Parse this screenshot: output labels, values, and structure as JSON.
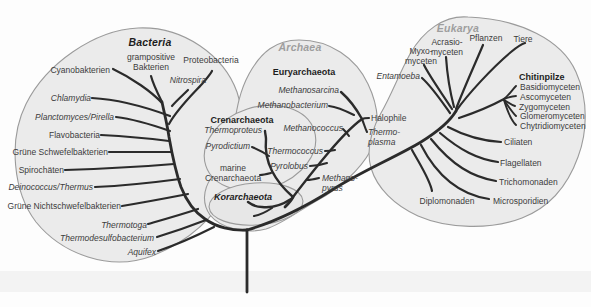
{
  "figure_type": "phylogenetic-tree-of-life",
  "colors": {
    "blob_fill": "#ebebeb",
    "blob_stroke": "#9b9b9b",
    "branch": "#2b2b2b",
    "label_text": "#3c3c3c",
    "domain_title_gray": "#9e9e9e",
    "domain_title_black": "#1d1d1d"
  },
  "bacteria": {
    "title": "Bacteria",
    "taxa": {
      "cyanobakterien": "Cyanobakterien",
      "grampositive": "grampositive\nBakterien",
      "proteobacteria": "Proteobacteria",
      "nitrospira": "Nitrospira",
      "chlamydia": "Chlamydia",
      "planctomyces": "Planctomyces/Pirella",
      "flavobacteria": "Flavobacteria",
      "gruene_schwefel": "Grüne Schwefelbakterien",
      "spirochaeten": "Spirochäten",
      "deinococcus": "Deinococcus/Thermus",
      "gruene_nichtschwefel": "Grüne Nichtschwefelbakterien",
      "thermotoga": "Thermotoga",
      "thermodesulfobacterium": "Thermodesulfobacterium",
      "aquifex": "Aquifex"
    }
  },
  "archaea": {
    "title": "Archaea",
    "clades": {
      "euryarchaeota": "Euryarchaeota",
      "crenarchaeota": "Crenarchaeota",
      "korarchaeota": "Korarchaeota"
    },
    "taxa": {
      "methanosarcina": "Methanosarcina",
      "methanobacterium": "Methanobacterium",
      "methanococcus": "Methanococcus",
      "halophile": "Halophile",
      "thermoplasma": "Thermo-\nplasma",
      "thermococcus": "Thermococcus",
      "pyrolobus": "Pyrolobus",
      "methanopyrus": "Methano-\npyrus",
      "thermoproteus": "Thermoproteus",
      "pyrodictium": "Pyrodictium",
      "marine_crenarchaeota": "marine\nCrenarchaeota"
    }
  },
  "eukarya": {
    "title": "Eukarya",
    "clades": {
      "chitinpilze": "Chitinpilze"
    },
    "taxa": {
      "myxomyceten": "Myxo-\nmyceten",
      "acrasiomyceten": "Acrasio-\nmyceten",
      "pflanzen": "Pflanzen",
      "tiere": "Tiere",
      "entamoeba": "Entamoeba",
      "basidiomyceten": "Basidiomyceten",
      "ascomyceten": "Ascomyceten",
      "zygomyceten": "Zygomyceten",
      "glomeromyceten": "Glomeromyceten",
      "chytridiomyceten": "Chytridiomyceten",
      "ciliaten": "Ciliaten",
      "flagellaten": "Flagellaten",
      "trichomonaden": "Trichomonaden",
      "microsporidien": "Microsporidien",
      "diplomonaden": "Diplomonaden"
    }
  }
}
